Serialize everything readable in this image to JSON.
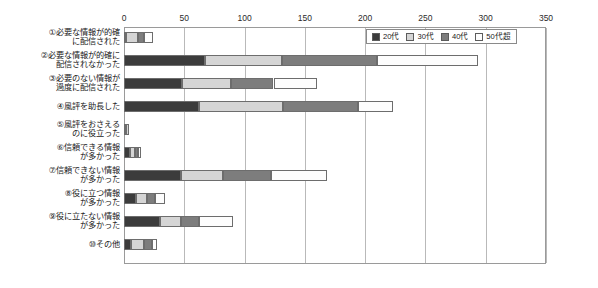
{
  "chart_data": {
    "type": "bar",
    "orientation": "horizontal",
    "stacked": true,
    "title": "",
    "xlabel": "",
    "ylabel": "",
    "xlim": [
      0,
      350
    ],
    "grid": true,
    "legend_position": "top-right",
    "xticks": [
      "0",
      "50",
      "100",
      "150",
      "200",
      "250",
      "300",
      "350"
    ],
    "xtick_values": [
      0,
      50,
      100,
      150,
      200,
      250,
      300,
      350
    ],
    "categories": [
      "①必要な情報が的確\nに配信された",
      "②必要な情報が的確に\n配信されなかった",
      "③必要のない情報が\n過度に配信された",
      "④風評を助長した",
      "⑤風評をおさえる\nのに役立った",
      "⑥信頼できる情報\nが多かった",
      "⑦信頼できない情報\nが多かった",
      "⑧役に立つ情報\nが多かった",
      "⑨役に立たない情報\nが多かった",
      "⑩その他"
    ],
    "series": [
      {
        "name": "20代",
        "color": "#3c3c3c",
        "values": [
          2,
          67,
          48,
          62,
          2,
          5,
          47,
          10,
          30,
          6
        ]
      },
      {
        "name": "30代",
        "color": "#d5d5d5",
        "values": [
          10,
          64,
          41,
          70,
          2,
          4,
          35,
          9,
          17,
          11
        ]
      },
      {
        "name": "40代",
        "color": "#7d7d7d",
        "values": [
          5,
          79,
          35,
          62,
          0,
          3,
          40,
          7,
          15,
          6
        ]
      },
      {
        "name": "50代超",
        "color": "#fdfdfd",
        "values": [
          7,
          84,
          36,
          29,
          0,
          2,
          46,
          8,
          28,
          4
        ]
      }
    ]
  },
  "legend": {
    "items": [
      {
        "label": "20代"
      },
      {
        "label": "30代"
      },
      {
        "label": "40代"
      },
      {
        "label": "50代超"
      }
    ]
  }
}
